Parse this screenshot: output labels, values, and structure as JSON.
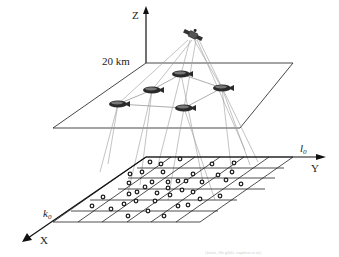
{
  "figure": {
    "type": "system-architecture-diagram",
    "axes": {
      "z_label": "Z",
      "y_label": "Y",
      "x_label": "X"
    },
    "altitude_label": "20 km",
    "grid_labels": {
      "l0": "l",
      "l0_sub": "0",
      "k0": "k",
      "k0_sub": "0"
    },
    "nodes": {
      "satellite": {
        "icon": "satellite-icon",
        "x": 193,
        "y": 35
      },
      "airships": [
        {
          "id": "A",
          "icon": "airship-icon",
          "x": 181,
          "y": 74
        },
        {
          "id": "B",
          "icon": "airship-icon",
          "x": 152,
          "y": 90
        },
        {
          "id": "C",
          "icon": "airship-icon",
          "x": 118,
          "y": 104
        },
        {
          "id": "D",
          "icon": "airship-icon",
          "x": 222,
          "y": 88
        },
        {
          "id": "E",
          "icon": "airship-icon",
          "x": 184,
          "y": 108
        }
      ],
      "ground_user_count": 40
    },
    "caption_partial": "(faint, illegible caption text)",
    "colors": {
      "line": "#1a1a1a",
      "link": "#9a9a9a",
      "airship": "#2a2a2a",
      "user": "#222222"
    }
  }
}
